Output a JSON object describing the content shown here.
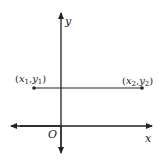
{
  "diagram": {
    "type": "coordinate-plane",
    "axes": {
      "x_label": "x",
      "y_label": "y",
      "origin_label": "O"
    },
    "segment": {
      "description": "horizontal line segment",
      "point1_label": "(x1,y1)",
      "point2_label": "(x2,y2)",
      "p1": {
        "x": "x",
        "sub": "1",
        "y": "y",
        "ysub": "1"
      },
      "p2": {
        "x": "x",
        "sub": "2",
        "y": "y",
        "ysub": "2"
      }
    },
    "colors": {
      "ink": "#222222",
      "background": "#ffffff"
    }
  }
}
